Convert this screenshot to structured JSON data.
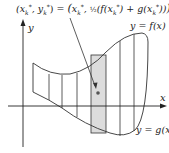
{
  "diagram": {
    "formula": "(x*k, y*k) = (x*k, ½(f(x*k) + g(x*k)))",
    "formula_left": "(x",
    "labels": {
      "y_axis": "y",
      "x_axis": "x",
      "top_curve": "y = f(x)",
      "bottom_curve": "y = g(x)"
    },
    "colors": {
      "highlight_strip": "#dcdcdc",
      "lines": "#333333"
    }
  }
}
